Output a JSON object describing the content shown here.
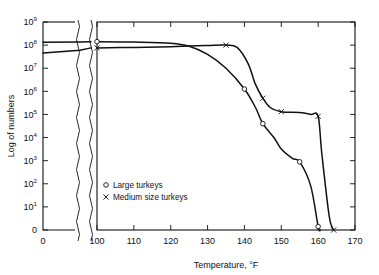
{
  "chart_data": {
    "type": "line",
    "title": "",
    "xlabel": "Temperature, °F",
    "ylabel": "Log of numbers",
    "xlim": [
      100,
      170
    ],
    "ylim": [
      0,
      9
    ],
    "y_scale": "log",
    "grid": false,
    "broken_axis": {
      "present": true,
      "inset_xlabel": "0",
      "note": "left stub panel at x = 0 separated from main panel by two wavy break lines"
    },
    "xticks": [
      100,
      110,
      120,
      130,
      140,
      150,
      160,
      170
    ],
    "xtick_labels": [
      "100",
      "110",
      "120",
      "130",
      "140",
      "150",
      "160",
      "170"
    ],
    "yticks": [
      0,
      1,
      2,
      3,
      4,
      5,
      6,
      7,
      8,
      9
    ],
    "ytick_labels": [
      "0",
      "10¹",
      "10²",
      "10³",
      "10⁴",
      "10⁵",
      "10⁶",
      "10⁷",
      "10⁸",
      "10⁹"
    ],
    "ytick_mantissa": [
      "0",
      "10",
      "10",
      "10",
      "10",
      "10",
      "10",
      "10",
      "10",
      "10"
    ],
    "ytick_exponent": [
      "",
      "1",
      "2",
      "3",
      "4",
      "5",
      "6",
      "7",
      "8",
      "9"
    ],
    "legend": {
      "position": "inside-lower-left",
      "entries": [
        {
          "label": "Large turkeys",
          "marker": "circle"
        },
        {
          "label": "Medium size turkeys",
          "marker": "cross"
        }
      ]
    },
    "series": [
      {
        "name": "Large turkeys",
        "marker": "circle",
        "stub_x": 0,
        "stub_log_value": 8.12,
        "x": [
          100,
          110,
          120,
          125,
          130,
          135,
          140,
          143,
          145,
          148,
          150,
          153,
          155,
          158,
          160,
          160.6
        ],
        "log_values": [
          8.15,
          8.13,
          8.08,
          7.95,
          7.6,
          7.0,
          6.1,
          5.3,
          4.6,
          4.0,
          3.5,
          3.1,
          2.95,
          1.9,
          0.15,
          0.0
        ],
        "labeled_points": [
          {
            "x": 100,
            "log_value": 8.15
          },
          {
            "x": 140,
            "log_value": 6.1
          },
          {
            "x": 145,
            "log_value": 4.6
          },
          {
            "x": 155,
            "log_value": 2.95
          },
          {
            "x": 160,
            "log_value": 0.15
          }
        ]
      },
      {
        "name": "Medium size turkeys",
        "marker": "cross",
        "stub_x": 0,
        "stub_log_value": 7.66,
        "x": [
          100,
          110,
          120,
          125,
          130,
          135,
          138,
          141,
          143,
          145,
          147,
          150,
          155,
          158,
          160,
          161,
          163,
          164.2
        ],
        "log_values": [
          7.88,
          7.9,
          7.93,
          7.96,
          7.98,
          8.0,
          7.9,
          7.2,
          6.3,
          5.7,
          5.3,
          5.12,
          5.08,
          5.0,
          4.92,
          3.3,
          0.6,
          0.0
        ],
        "labeled_points": [
          {
            "x": 100,
            "log_value": 7.88
          },
          {
            "x": 135,
            "log_value": 8.0
          },
          {
            "x": 145,
            "log_value": 5.7
          },
          {
            "x": 150,
            "log_value": 5.12
          },
          {
            "x": 160,
            "log_value": 4.92
          },
          {
            "x": 164.2,
            "log_value": 0.0
          }
        ]
      }
    ]
  }
}
